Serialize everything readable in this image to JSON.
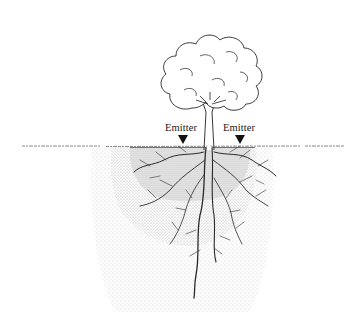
{
  "diagram": {
    "title": "",
    "labels": {
      "emitter_left": "Emitter",
      "emitter_right": "Emitter"
    },
    "icons": {
      "emitter_marker": "triangle-down-icon",
      "tree": "tree-icon"
    },
    "colors": {
      "ink": "#1a1a1a",
      "inner_zone": "#d9d9d9",
      "middle_zone": "#ebebeb",
      "outer_zone": "#f5f5f5",
      "background": "#ffffff"
    }
  }
}
